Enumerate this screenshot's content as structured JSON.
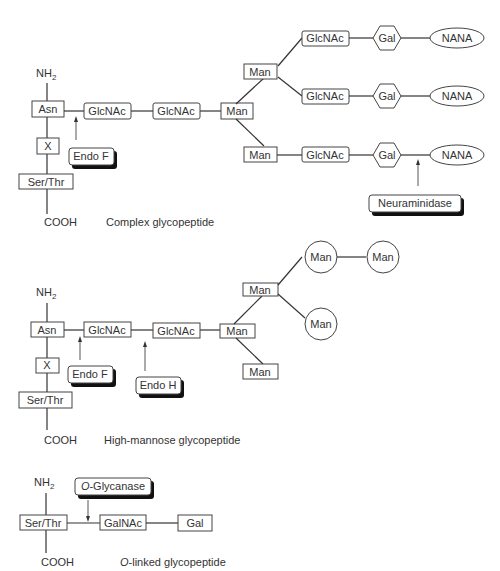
{
  "complex": {
    "nh2": "NH",
    "nh2_sub": "2",
    "asn": "Asn",
    "x": "X",
    "serthr": "Ser/Thr",
    "cooh": "COOH",
    "glcnac1": "GlcNAc",
    "glcnac2": "GlcNAc",
    "man_core": "Man",
    "man_upper": "Man",
    "man_lower": "Man",
    "branches": [
      {
        "glcnac": "GlcNAc",
        "gal": "Gal",
        "nana": "NANA"
      },
      {
        "glcnac": "GlcNAc",
        "gal": "Gal",
        "nana": "NANA"
      },
      {
        "glcnac": "GlcNAc",
        "gal": "Gal",
        "nana": "NANA"
      }
    ],
    "enzyme_endo_f": "Endo F",
    "enzyme_neuraminidase": "Neuraminidase",
    "caption": "Complex glycopeptide"
  },
  "high_mannose": {
    "nh2": "NH",
    "nh2_sub": "2",
    "asn": "Asn",
    "x": "X",
    "serthr": "Ser/Thr",
    "cooh": "COOH",
    "glcnac1": "GlcNAc",
    "glcnac2": "GlcNAc",
    "man_core": "Man",
    "man_upper": "Man",
    "man_lower": "Man",
    "man_circle1": "Man",
    "man_circle2": "Man",
    "man_circle3": "Man",
    "enzyme_endo_f": "Endo F",
    "enzyme_endo_h": "Endo H",
    "caption": "High-mannose glycopeptide"
  },
  "o_linked": {
    "nh2": "NH",
    "nh2_sub": "2",
    "serthr": "Ser/Thr",
    "cooh": "COOH",
    "galnac": "GalNAc",
    "gal": "Gal",
    "enzyme_o_prefix": "O",
    "enzyme_o_rest": "-Glycanase",
    "caption_prefix": "O",
    "caption_rest": "-linked glycopeptide"
  }
}
